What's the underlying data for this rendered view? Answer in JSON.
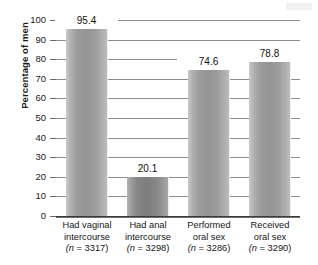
{
  "chart_data": {
    "type": "bar",
    "title": "",
    "xlabel": "",
    "ylabel": "Percentage of men",
    "ylim": [
      0,
      100
    ],
    "yticks": [
      100,
      90,
      80,
      70,
      60,
      50,
      40,
      30,
      20,
      10,
      0
    ],
    "grid": true,
    "legend": "none",
    "categories": [
      "Had vaginal intercourse",
      "Had anal intercourse",
      "Performed oral sex",
      "Received oral sex"
    ],
    "values": [
      95.4,
      20.1,
      74.6,
      78.8
    ],
    "data_labels": [
      "95.4",
      "20.1",
      "74.6",
      "78.8"
    ],
    "sample_sizes": [
      3317,
      3298,
      3286,
      3290
    ],
    "bars": [
      {
        "value": 95.4,
        "label": "95.4",
        "line1": "Had vaginal",
        "line2": "intercourse",
        "n_prefix": "(n",
        "n_value": " = 3317)",
        "shade": "light"
      },
      {
        "value": 20.1,
        "label": "20.1",
        "line1": "Had anal",
        "line2": "intercourse",
        "n_prefix": "(n",
        "n_value": " = 3298)",
        "shade": "dark"
      },
      {
        "value": 74.6,
        "label": "74.6",
        "line1": "Performed",
        "line2": "oral sex",
        "n_prefix": "(n",
        "n_value": " = 3286)",
        "shade": "light"
      },
      {
        "value": 78.8,
        "label": "78.8",
        "line1": "Received",
        "line2": "oral sex",
        "n_prefix": "(n",
        "n_value": " = 3290)",
        "shade": "light"
      }
    ],
    "colors": {
      "bar_light_mid": "#949494",
      "bar_dark_mid": "#7d7d7d",
      "gridline": "#8e8e8e",
      "axis": "#3a3a3a",
      "text": "#151515",
      "background": "#ffffff"
    }
  }
}
